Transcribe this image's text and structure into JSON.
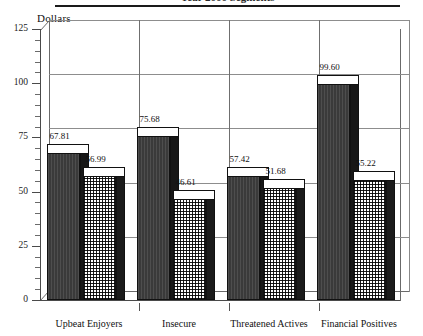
{
  "title": {
    "text_clipped": "Year 2000 Segments",
    "note": "title row is cropped at the top edge of the screenshot; only the rule beneath it is fully visible"
  },
  "axis": {
    "y_title": "Dollars",
    "y_ticks": [
      "0",
      "25",
      "50",
      "75",
      "100",
      "125"
    ]
  },
  "chart_data": {
    "type": "bar",
    "title": "Year 2000 Segments",
    "xlabel": "",
    "ylabel": "Dollars",
    "ylim": [
      0,
      125
    ],
    "ytick_step": 25,
    "yminor_step": 5,
    "grid": "horizontal gridlines at each major tick, vertical separators between category groups",
    "legend": "none shown",
    "style": "3D clustered column chart, black and white, series distinguished by fill pattern",
    "categories": [
      "Upbeat Enjoyers",
      "Insecure",
      "Threatened Actives",
      "Financial Positives"
    ],
    "series": [
      {
        "name": "series-1",
        "fill": "solid dark",
        "values": [
          67.81,
          75.68,
          57.42,
          99.6
        ],
        "labels": [
          "67.81",
          "75.68",
          "57.42",
          "99.60"
        ]
      },
      {
        "name": "series-2",
        "fill": "checkered grid",
        "values": [
          56.99,
          46.61,
          51.68,
          55.22
        ],
        "labels": [
          "56.99",
          "46.61",
          "51.68",
          "55.22"
        ]
      }
    ]
  },
  "colors": {
    "ink": "#111111",
    "series1": "#3a3a3a",
    "series2_ink": "#1c1c1c",
    "grid": "#8d8d8d",
    "frame": "#6a6a6a",
    "background": "#ffffff"
  }
}
